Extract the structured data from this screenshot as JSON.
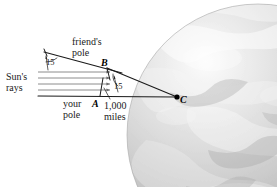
{
  "figure": {
    "background_color": "#ffffff",
    "width": 277,
    "height": 187
  },
  "globe": {
    "name": "earth-globe",
    "description": "grayscale satellite image of Earth, sphere cropped at right and bottom edges",
    "center_x": 258,
    "center_y": 135,
    "radius": 131,
    "base_color": "#b4b4b4",
    "highlight_color": "#f2f2f2",
    "shadow_color": "#8c8c8c"
  },
  "labels": {
    "suns_rays": "Sun's\nrays",
    "friends_pole": "friend's\npole",
    "your_pole": "your\npole",
    "distance": "1,000\nmiles",
    "angle_top": "15",
    "angle_center": "15"
  },
  "points": {
    "a": "A",
    "b": "B",
    "c": "C"
  },
  "geometry": {
    "point_a": {
      "x": 100,
      "y": 95
    },
    "point_b": {
      "x": 107,
      "y": 67
    },
    "point_c": {
      "x": 177,
      "y": 98
    },
    "rays": {
      "count": 5,
      "x_start": 38,
      "x_end": 112,
      "y_values": [
        72,
        78,
        84,
        90,
        96
      ],
      "color": "#6e6e6e"
    },
    "sloped_pole_line": {
      "x1": 44,
      "y1": 53,
      "x2": 120,
      "y2": 72
    },
    "horizontal_base_line": {
      "x1": 38,
      "y1": 96,
      "x2": 177,
      "y2": 96
    },
    "line_color": "#1a1a1a"
  },
  "colors": {
    "ink": "#1a1a1a",
    "ray_gray": "#6e6e6e",
    "globe_gray": "#b4b4b4"
  }
}
